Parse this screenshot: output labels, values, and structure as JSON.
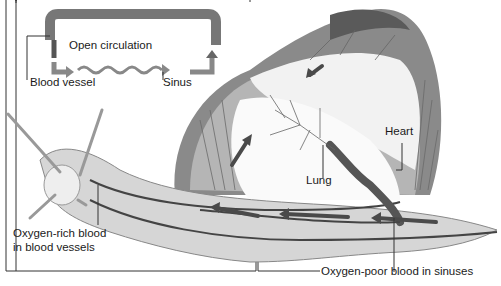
{
  "figure": {
    "inset": {
      "title": "Open circulation",
      "labels": {
        "vessel": "Blood vessel",
        "sinus": "Sinus"
      }
    },
    "labels": {
      "heart": "Heart",
      "lung": "Lung",
      "oxygen_rich_line1": "Oxygen-rich blood",
      "oxygen_rich_line2": "in blood vessels",
      "oxygen_poor": "Oxygen-poor blood in sinuses"
    },
    "colors": {
      "vessel": "#6e6e6e",
      "arrow": "#4a4a4a",
      "shell_dark": "#5a5a5a",
      "body": "#d8d8d8",
      "line": "#2a2a2a"
    }
  }
}
